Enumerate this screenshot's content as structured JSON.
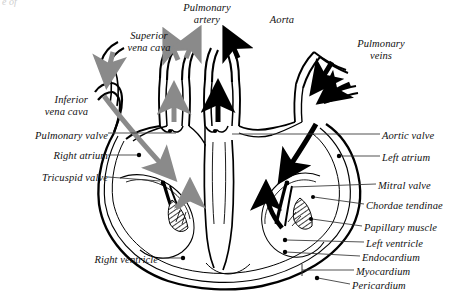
{
  "figure": {
    "kind": "anatomical-diagram",
    "cropped_top_text": "e of",
    "colors": {
      "outline": "#000000",
      "background": "#ffffff",
      "deoxygenated_arrow": "#8a8a8a",
      "oxygenated_arrow": "#000000",
      "leader_line": "#333333",
      "label_text": "#111111"
    },
    "legend_note": {
      "gray": "deoxygenated blood flow",
      "black": "oxygenated blood flow"
    }
  },
  "labels": [
    {
      "id": "superior-vena-cava",
      "text": "Superior\nvena cava",
      "align": "center",
      "x": 110,
      "y": 30,
      "w": 78
    },
    {
      "id": "pulmonary-artery",
      "text": "Pulmonary\nartery",
      "align": "center",
      "x": 168,
      "y": 2,
      "w": 78
    },
    {
      "id": "aorta",
      "text": "Aorta",
      "align": "center",
      "x": 258,
      "y": 14,
      "w": 48
    },
    {
      "id": "pulmonary-veins",
      "text": "Pulmonary\nveins",
      "align": "center",
      "x": 342,
      "y": 38,
      "w": 78
    },
    {
      "id": "inferior-vena-cava",
      "text": "Inferior\nvena cava",
      "align": "right",
      "x": 10,
      "y": 94,
      "w": 78
    },
    {
      "id": "pulmonary-valve",
      "text": "Pulmonary valve",
      "align": "right",
      "x": 2,
      "y": 130,
      "w": 106
    },
    {
      "id": "right-atrium",
      "text": "Right atrium",
      "align": "right",
      "x": 12,
      "y": 150,
      "w": 96
    },
    {
      "id": "tricuspid-valve",
      "text": "Tricuspid valve",
      "align": "right",
      "x": 6,
      "y": 172,
      "w": 102
    },
    {
      "id": "right-ventricle",
      "text": "Right ventricle",
      "align": "right",
      "x": 58,
      "y": 254,
      "w": 100
    },
    {
      "id": "aortic-valve",
      "text": "Aortic valve",
      "align": "left",
      "x": 382,
      "y": 130,
      "w": 82
    },
    {
      "id": "left-atrium",
      "text": "Left atrium",
      "align": "left",
      "x": 382,
      "y": 152,
      "w": 82
    },
    {
      "id": "mitral-valve",
      "text": "Mitral valve",
      "align": "left",
      "x": 378,
      "y": 180,
      "w": 84
    },
    {
      "id": "chordae-tendinae",
      "text": "Chordae tendinae",
      "align": "left",
      "x": 366,
      "y": 200,
      "w": 98
    },
    {
      "id": "papillary-muscle",
      "text": "Papillary muscle",
      "align": "left",
      "x": 364,
      "y": 222,
      "w": 99
    },
    {
      "id": "left-ventricle",
      "text": "Left ventricle",
      "align": "left",
      "x": 366,
      "y": 238,
      "w": 96
    },
    {
      "id": "endocardium",
      "text": "Endocardium",
      "align": "left",
      "x": 362,
      "y": 252,
      "w": 100
    },
    {
      "id": "myocardium",
      "text": "Myocardium",
      "align": "left",
      "x": 356,
      "y": 266,
      "w": 104
    },
    {
      "id": "pericardium",
      "text": "Pericardium",
      "align": "left",
      "x": 352,
      "y": 280,
      "w": 108
    }
  ]
}
